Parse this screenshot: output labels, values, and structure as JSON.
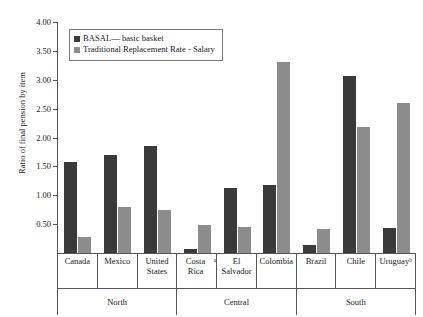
{
  "chart_data": {
    "type": "bar",
    "title": "",
    "xlabel": "",
    "ylabel": "Ratio of final pension by item",
    "ylim": [
      0,
      4.0
    ],
    "ytick_step": 0.5,
    "yticks": [
      "4.00",
      "3.50",
      "3.00",
      "2.50",
      "2.00",
      "1.50",
      "1.00",
      "0.50"
    ],
    "grid": false,
    "legend_position": "top-left",
    "categories": [
      "Canada",
      "Mexico",
      "United States",
      "Costa Rica",
      "El Salvador",
      "Colombia",
      "Brazil",
      "Chile",
      "Uruguay"
    ],
    "category_footnotes": [
      "",
      "",
      "",
      "a",
      "",
      "",
      "",
      "",
      "b"
    ],
    "groups": [
      {
        "label": "North",
        "span": 3
      },
      {
        "label": "Central",
        "span": 3
      },
      {
        "label": "South",
        "span": 3
      }
    ],
    "series": [
      {
        "name": "BASAL— basic basket",
        "color": "#3a3a3a",
        "values": [
          1.58,
          1.69,
          1.85,
          0.07,
          1.12,
          1.17,
          0.14,
          3.07,
          0.43
        ]
      },
      {
        "name": "Traditional Replacement Rate - Salary",
        "color": "#8c8c8c",
        "values": [
          0.27,
          0.8,
          0.74,
          0.48,
          0.45,
          3.31,
          0.42,
          2.18,
          2.6
        ]
      }
    ]
  }
}
